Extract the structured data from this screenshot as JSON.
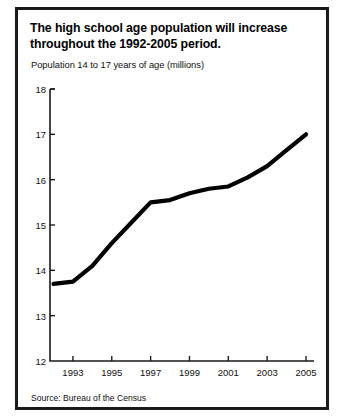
{
  "figure": {
    "title": "The high school age population will increase throughout the 1992-2005 period.",
    "title_line_1": "The high school age population will increase",
    "title_line_2": "throughout the 1992-2005 period.",
    "subtitle": "Population 14 to 17 years of age (millions)",
    "source": "Source: Bureau of the Census",
    "border_color": "#1a1a1a",
    "background_color": "#ffffff",
    "line_color": "#000000"
  },
  "chart_data": {
    "type": "line",
    "title": "The high school age population will increase throughout the 1992-2005 period.",
    "subtitle": "Population 14 to 17 years of age (millions)",
    "xlabel": "",
    "ylabel": "Population 14 to 17 years of age (millions)",
    "ylim": [
      12,
      18
    ],
    "xlim": [
      1992,
      2005
    ],
    "yticks": [
      12,
      13,
      14,
      15,
      16,
      17,
      18
    ],
    "ytick_labels": [
      "12",
      "13",
      "14",
      "15",
      "16",
      "17",
      "18"
    ],
    "xticks": [
      1993,
      1995,
      1997,
      1999,
      2001,
      2003,
      2005
    ],
    "xtick_labels": [
      "1993",
      "1995",
      "1997",
      "1999",
      "2001",
      "2003",
      "2005"
    ],
    "grid": false,
    "legend": null,
    "series": [
      {
        "name": "Population 14 to 17 years of age (millions)",
        "color": "#000000",
        "x": [
          1992,
          1993,
          1994,
          1995,
          1996,
          1997,
          1998,
          1999,
          2000,
          2001,
          2002,
          2003,
          2004,
          2005
        ],
        "values": [
          13.7,
          13.75,
          14.1,
          14.6,
          15.05,
          15.5,
          15.55,
          15.7,
          15.8,
          15.85,
          16.05,
          16.3,
          16.65,
          17.0
        ]
      }
    ],
    "annotations": [],
    "source": "Source: Bureau of the Census"
  }
}
